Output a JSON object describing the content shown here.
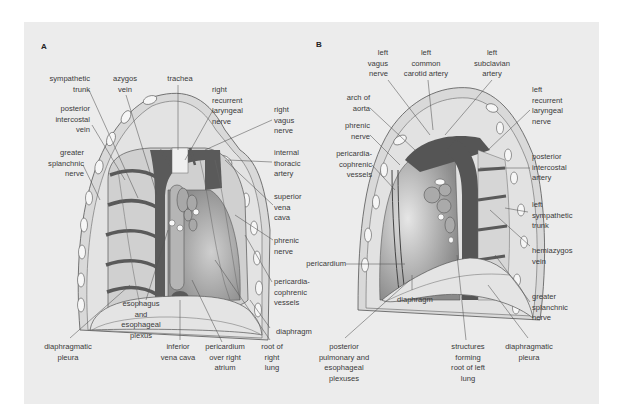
{
  "figure": {
    "panel_a": {
      "letter": "A",
      "labels": {
        "sympathetic_trunk": "sympathetic\ntrunk",
        "azygos_vein": "azygos\nvein",
        "trachea": "trachea",
        "right_recurrent_laryngeal_nerve": "right\nrecurrent\nlaryngeal\nnerve",
        "right_vagus_nerve": "right\nvagus\nnerve",
        "posterior_intercostal_vein": "posterior\nintercostal\nvein",
        "internal_thoracic_artery": "internal\nthoracic\nartery",
        "greater_splanchnic_nerve": "greater\nsplanchnic\nnerve",
        "superior_vena_cava": "superior\nvena\ncava",
        "phrenic_nerve": "phrenic\nnerve",
        "pericardiacophrenic_vessels": "pericardia-\ncophrenic\nvessels",
        "diaphragm": "diaphragm",
        "esophagus_and_esophageal_plexus": "esophagus\nand\nesophageal\nplexus",
        "diaphragmatic_pleura": "diaphragmatic\npleura",
        "inferior_vena_cava": "inferior\nvena cava",
        "pericardium_over_right_atrium": "pericardium\nover right\natrium",
        "root_of_right_lung": "root of\nright\nlung"
      }
    },
    "panel_b": {
      "letter": "B",
      "labels": {
        "left_vagus_nerve": "left\nvagus\nnerve",
        "left_common_carotid_artery": "left\ncommon\ncarotid artery",
        "left_subclavian_artery": "left\nsubclavian\nartery",
        "arch_of_aorta": "arch of\naorta",
        "left_recurrent_laryngeal_nerve": "left\nrecurrent\nlaryngeal\nnerve",
        "phrenic_nerve": "phrenic\nnerve",
        "pericardiacophrenic_vessels": "pericardia-\ncophrenic\nvessels",
        "posterior_intercostal_artery": "posterior\nintercostal\nartery",
        "left_sympathetic_trunk": "left\nsympathetic\ntrunk",
        "pericardium": "pericardium",
        "hemiazygos_vein": "hemiazygos\nvein",
        "diaphragm": "diaphragm",
        "greater_splanchnic_nerve": "greater\nsplanchnic\nnerve",
        "posterior_pulmonary_and_esophageal_plexuses": "posterior\npulmonary and\nesophageal\nplexuses",
        "structures_forming_root_of_left_lung": "structures\nforming\nroot of left\nlung",
        "diaphragmatic_pleura": "diaphragmatic\npleura"
      }
    },
    "colors": {
      "background": "#ececec",
      "dark_vessel": "#555555",
      "mid_gray": "#9a9a9a",
      "light_gray": "#d6d6d6",
      "white_fat": "#f6f6f6",
      "line": "#555555",
      "text": "#3a3a3a"
    }
  }
}
